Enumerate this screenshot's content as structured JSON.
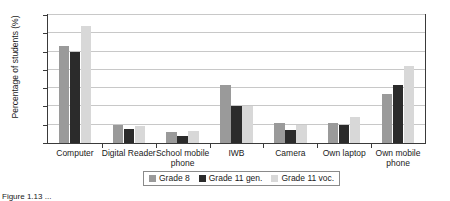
{
  "chart_data": {
    "type": "bar",
    "title": "",
    "xlabel": "",
    "ylabel": "Percentage of students (%)",
    "ylim": [
      0,
      70
    ],
    "yticks": [
      0,
      10,
      20,
      30,
      40,
      50,
      60,
      70
    ],
    "grid": true,
    "legend_position": "bottom",
    "categories": [
      "Computer",
      "Digital Reader",
      "School mobile phone",
      "IWB",
      "Camera",
      "Own laptop",
      "Own mobile phone"
    ],
    "series": [
      {
        "name": "Grade 8",
        "color": "#9a9a9a",
        "values": [
          53,
          10,
          6,
          32,
          11,
          11,
          27
        ]
      },
      {
        "name": "Grade 11 gen.",
        "color": "#2b2b2b",
        "values": [
          50,
          7.5,
          4,
          20,
          7,
          10,
          32
        ]
      },
      {
        "name": "Grade 11 voc.",
        "color": "#d8d8d8",
        "values": [
          64,
          9.5,
          6.5,
          20,
          10,
          14,
          42
        ]
      }
    ]
  },
  "caption": "Figure 1.13 ..."
}
